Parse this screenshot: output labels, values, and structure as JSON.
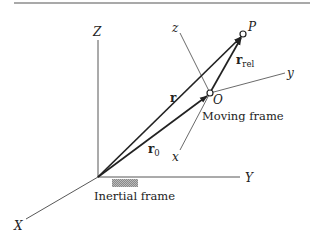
{
  "figure": {
    "colors": {
      "ink": "#222222",
      "axis": "#444444",
      "hatch": "#888888",
      "background": "#ffffff"
    },
    "inertial_frame": {
      "label": "Inertial frame",
      "axes": {
        "X": "X",
        "Y": "Y",
        "Z": "Z"
      }
    },
    "moving_frame": {
      "label": "Moving frame",
      "origin_label": "O",
      "axes": {
        "x": "x",
        "y": "y",
        "z": "z"
      }
    },
    "point": {
      "label": "P"
    },
    "vectors": {
      "r": {
        "main": "r",
        "sub": ""
      },
      "r0": {
        "main": "r",
        "sub": "0"
      },
      "rrel": {
        "main": "r",
        "sub": "rel"
      }
    }
  }
}
